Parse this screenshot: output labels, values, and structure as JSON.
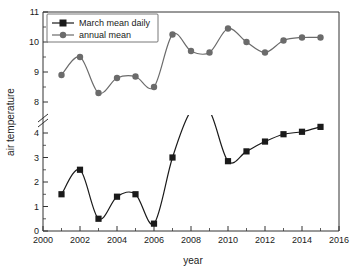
{
  "chart_data": {
    "type": "line",
    "title": "",
    "xlabel": "year",
    "ylabel": "air temperature",
    "xlim": [
      2000,
      2016
    ],
    "xticks": [
      2000,
      2002,
      2004,
      2006,
      2008,
      2010,
      2012,
      2014,
      2016
    ],
    "xminorticks": [
      2001,
      2003,
      2005,
      2007,
      2009,
      2011,
      2013,
      2015
    ],
    "y_axis_broken": true,
    "y_lower_panel": {
      "range": [
        0,
        5
      ],
      "ticks": [
        0,
        1,
        2,
        3,
        4
      ],
      "minorticks": [
        0.5,
        1.5,
        2.5,
        3.5,
        4.5
      ]
    },
    "y_upper_panel": {
      "range": [
        7.7,
        11
      ],
      "ticks": [
        8,
        9,
        10,
        11
      ],
      "minorticks": [
        8.5,
        9.5,
        10.5
      ]
    },
    "grid": false,
    "legend_position": "top-left",
    "x": [
      2001,
      2002,
      2003,
      2004,
      2005,
      2006,
      2007,
      2008,
      2009,
      2010,
      2011,
      2012,
      2013,
      2014,
      2015
    ],
    "series": [
      {
        "name": "March mean daily",
        "marker": "square",
        "color": "#1a1a1a",
        "values": [
          1.5,
          2.5,
          0.5,
          1.4,
          1.5,
          0.3,
          3.0,
          4.9,
          4.9,
          2.85,
          3.25,
          3.65,
          3.95,
          4.05,
          4.25
        ]
      },
      {
        "name": "annual mean",
        "marker": "circle",
        "color": "#6b6b6b",
        "values": [
          8.9,
          9.5,
          8.3,
          8.8,
          8.85,
          8.5,
          10.25,
          9.7,
          9.65,
          10.45,
          10.0,
          9.65,
          10.05,
          10.15,
          10.15
        ]
      }
    ]
  },
  "axes": {
    "x_title": "year",
    "y_title": "air temperature",
    "x_tick_labels": [
      "2000",
      "2002",
      "2004",
      "2006",
      "2008",
      "2010",
      "2012",
      "2014",
      "2016"
    ],
    "y_tick_labels_upper": [
      "8",
      "9",
      "10",
      "11"
    ],
    "y_tick_labels_lower": [
      "0",
      "1",
      "2",
      "3",
      "4"
    ]
  },
  "legend": {
    "items": [
      {
        "label": "March mean daily",
        "marker": "square",
        "color": "#1a1a1a"
      },
      {
        "label": "annual mean",
        "marker": "circle",
        "color": "#6b6b6b"
      }
    ]
  },
  "colors": {
    "series_black": "#1a1a1a",
    "series_gray": "#6b6b6b",
    "axis": "#333333",
    "background": "#ffffff"
  }
}
